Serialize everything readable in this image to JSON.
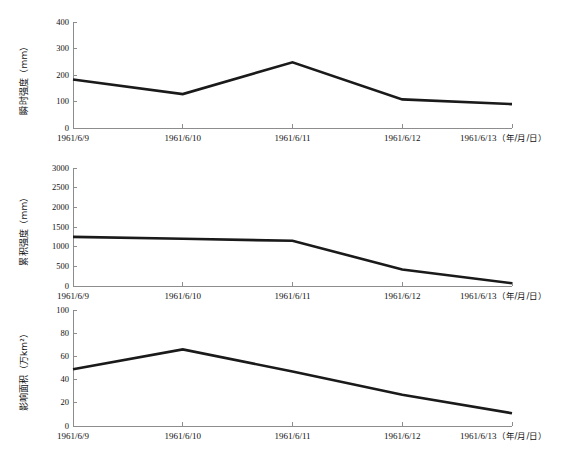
{
  "figure": {
    "background": "#ffffff",
    "line_color": "#1a1a1a",
    "axis_color": "#8d8d8d",
    "x_unit_label": "（年/月/日）"
  },
  "chart_data": [
    {
      "type": "line",
      "title": "",
      "xlabel": "（年/月/日）",
      "ylabel": "瞬时强度（mm）",
      "categories": [
        "1961/6/9",
        "1961/6/10",
        "1961/6/11",
        "1961/6/12",
        "1961/6/13"
      ],
      "values": [
        183,
        128,
        248,
        108,
        90
      ],
      "ylim": [
        0,
        400
      ],
      "yticks": [
        0,
        100,
        200,
        300,
        400
      ],
      "ytick_labels": [
        "0",
        "100",
        "200",
        "300",
        "400"
      ],
      "grid": false,
      "legend": "none"
    },
    {
      "type": "line",
      "title": "",
      "xlabel": "（年/月/日）",
      "ylabel": "累积强度（mm）",
      "categories": [
        "1961/6/9",
        "1961/6/10",
        "1961/6/11",
        "1961/6/12",
        "1961/6/13"
      ],
      "values": [
        1250,
        1200,
        1150,
        420,
        70
      ],
      "ylim": [
        0,
        3000
      ],
      "yticks": [
        0,
        500,
        1000,
        1500,
        2000,
        2500,
        3000
      ],
      "ytick_labels": [
        "0",
        "500",
        "1000",
        "1500",
        "2000",
        "2500",
        "3000"
      ],
      "grid": false,
      "legend": "none"
    },
    {
      "type": "line",
      "title": "",
      "xlabel": "（年/月/日）",
      "ylabel": "影响面积（万km²）",
      "categories": [
        "1961/6/9",
        "1961/6/10",
        "1961/6/11",
        "1961/6/12",
        "1961/6/13"
      ],
      "values": [
        49,
        66,
        47,
        27,
        11
      ],
      "ylim": [
        0,
        100
      ],
      "yticks": [
        0,
        20,
        40,
        60,
        80,
        100
      ],
      "ytick_labels": [
        "0",
        "20",
        "40",
        "60",
        "80",
        "100"
      ],
      "grid": false,
      "legend": "none"
    }
  ]
}
